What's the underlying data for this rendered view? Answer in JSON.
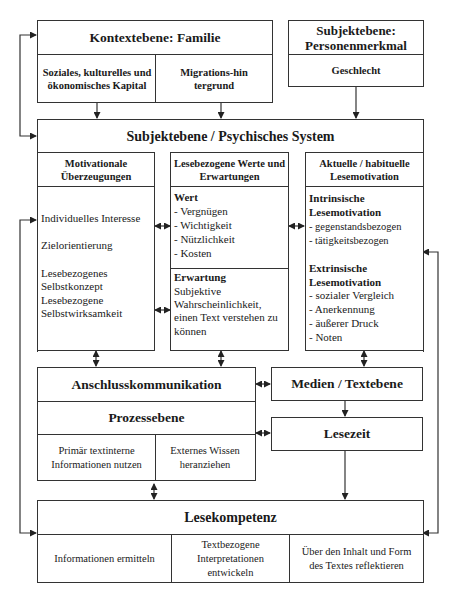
{
  "kontext": {
    "title": "Kontextebene: Familie",
    "cells": [
      "Soziales, kulturelles und ökonomisches Kapital",
      "Migrations-hintergrund"
    ]
  },
  "person": {
    "title": "Subjektebene: Personenmerkmal",
    "cells": [
      "Geschlecht"
    ]
  },
  "psychisch": {
    "title": "Subjektebene / Psychisches System",
    "columns": [
      {
        "header": "Motivationale Überzeugungen",
        "items": [
          "Individuelles Interesse",
          "Zielorientierung",
          "Lesebezogenes Selbstkonzept",
          "Lesebezogene Selbstwirksamkeit"
        ]
      },
      {
        "header": "Lesebezogene Werte und Erwartungen",
        "wert": {
          "label": "Wert",
          "items": [
            "- Vergnügen",
            "- Wichtigkeit",
            "- Nützlichkeit",
            "- Kosten"
          ]
        },
        "erwartung": {
          "label": "Erwartung",
          "text": "Subjektive Wahrscheinlichkeit, einen Text verstehen zu können"
        }
      },
      {
        "header": "Aktuelle / habituelle Lesemotivation",
        "intrinsisch": {
          "label": "Intrinsische Lesemotivation",
          "items": [
            "- gegenstandsbezogen",
            "- tätigkeitsbezogen"
          ]
        },
        "extrinsisch": {
          "label": "Extrinsische Lesemotivation",
          "items": [
            "- sozialer Vergleich",
            "- Anerkennung",
            "- äußerer Druck",
            "- Noten"
          ]
        }
      }
    ]
  },
  "anschluss": {
    "title": "Anschlusskommunikation"
  },
  "prozess": {
    "title": "Prozessebene",
    "cells": [
      "Primär textinterne Informationen nutzen",
      "Externes Wissen heranziehen"
    ]
  },
  "medien": {
    "title": "Medien / Textebene"
  },
  "lesezeit": {
    "title": "Lesezeit"
  },
  "lesekompetenz": {
    "title": "Lesekompetenz",
    "cells": [
      "Informationen ermitteln",
      "Textbezogene Interpretationen entwickeln",
      "Über den Inhalt und Form des Textes reflektieren"
    ]
  },
  "colors": {
    "line": "#333333",
    "text": "#1a1a1a",
    "background": "#ffffff"
  }
}
